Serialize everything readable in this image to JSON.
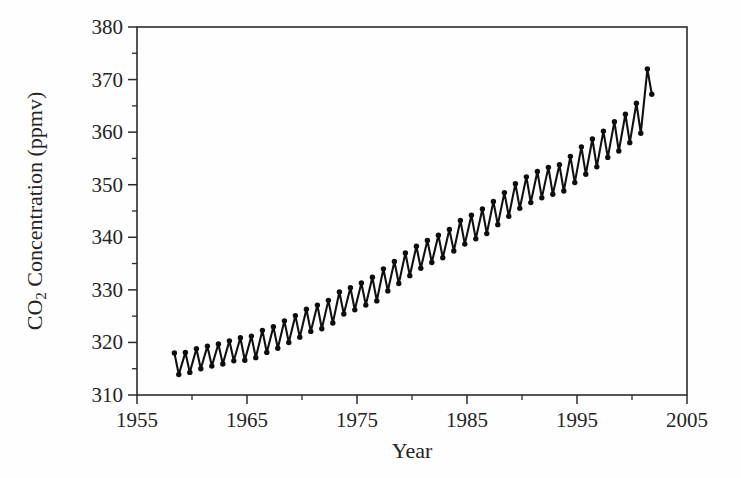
{
  "chart_data": {
    "type": "line",
    "title": "",
    "xlabel": "Year",
    "ylabel": "CO2 Concentration (ppmv)",
    "ylabel_parts": {
      "prefix": "CO",
      "subscript": "2",
      "suffix": " Concentration (ppmv)"
    },
    "xlim": [
      1955,
      2005
    ],
    "ylim": [
      310,
      380
    ],
    "xticks": [
      1955,
      1965,
      1975,
      1985,
      1995,
      2005
    ],
    "xtick_labels": [
      "1955",
      "1965",
      "1975",
      "1985",
      "1995",
      "2005"
    ],
    "yticks": [
      310,
      320,
      330,
      340,
      350,
      360,
      370,
      380
    ],
    "ytick_labels": [
      "310",
      "320",
      "330",
      "340",
      "350",
      "360",
      "370",
      "380"
    ],
    "x_minor_interval": 5,
    "y_minor_interval": 5,
    "grid": false,
    "legend": false,
    "marker": "circle",
    "marker_color": "#0d0d0d",
    "line_color": "#111111",
    "series": [
      {
        "name": "Mauna Loa monthly mean CO2 (seasonal peaks and troughs)",
        "x": [
          1958.4,
          1958.8,
          1959.4,
          1959.8,
          1960.4,
          1960.8,
          1961.4,
          1961.8,
          1962.4,
          1962.8,
          1963.4,
          1963.8,
          1964.4,
          1964.8,
          1965.4,
          1965.8,
          1966.4,
          1966.8,
          1967.4,
          1967.8,
          1968.4,
          1968.8,
          1969.4,
          1969.8,
          1970.4,
          1970.8,
          1971.4,
          1971.8,
          1972.4,
          1972.8,
          1973.4,
          1973.8,
          1974.4,
          1974.8,
          1975.4,
          1975.8,
          1976.4,
          1976.8,
          1977.4,
          1977.8,
          1978.4,
          1978.8,
          1979.4,
          1979.8,
          1980.4,
          1980.8,
          1981.4,
          1981.8,
          1982.4,
          1982.8,
          1983.4,
          1983.8,
          1984.4,
          1984.8,
          1985.4,
          1985.8,
          1986.4,
          1986.8,
          1987.4,
          1987.8,
          1988.4,
          1988.8,
          1989.4,
          1989.8,
          1990.4,
          1990.8,
          1991.4,
          1991.8,
          1992.4,
          1992.8,
          1993.4,
          1993.8,
          1994.4,
          1994.8,
          1995.4,
          1995.8,
          1996.4,
          1996.8,
          1997.4,
          1997.8,
          1998.4,
          1998.8,
          1999.4,
          1999.8,
          2000.4,
          2000.8,
          2001.4,
          2001.8
        ],
        "y": [
          318.0,
          313.9,
          318.1,
          314.3,
          318.8,
          315.0,
          319.3,
          315.5,
          319.7,
          315.9,
          320.3,
          316.5,
          320.9,
          316.6,
          321.2,
          317.1,
          322.3,
          318.1,
          323.0,
          318.9,
          324.1,
          320.0,
          325.1,
          321.0,
          326.3,
          322.1,
          327.1,
          322.6,
          328.0,
          323.7,
          329.6,
          325.4,
          330.4,
          326.2,
          331.3,
          327.1,
          332.4,
          327.9,
          334.0,
          329.8,
          335.4,
          331.2,
          337.0,
          332.7,
          338.3,
          334.1,
          339.4,
          335.2,
          340.4,
          336.1,
          341.5,
          337.4,
          343.2,
          338.7,
          344.2,
          339.7,
          345.4,
          340.7,
          346.8,
          342.4,
          348.5,
          344.0,
          350.2,
          345.5,
          351.5,
          346.6,
          352.5,
          347.5,
          353.3,
          348.2,
          353.8,
          348.8,
          355.4,
          350.4,
          357.2,
          352.0,
          358.7,
          353.4,
          360.2,
          355.2,
          362.0,
          356.4,
          363.4,
          358.0,
          365.5,
          359.8,
          372.0,
          367.2
        ]
      }
    ],
    "annotations": [],
    "notes": {
      "data_start_year": "1958",
      "data_end_year": "2001",
      "trend": "rising",
      "oscillation": "annual seasonal cycle, amplitude about 4 to 6 ppmv"
    }
  }
}
